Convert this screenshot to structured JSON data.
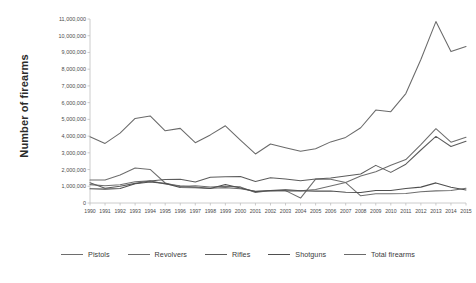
{
  "chart_data": {
    "type": "line",
    "title": "",
    "xlabel": "",
    "ylabel": "Number of firearms",
    "grid": false,
    "legend_position": "bottom",
    "ylim": [
      0,
      11000000
    ],
    "ytick_labels": [
      "11,000,000",
      "10,000,000",
      "9,000,000",
      "8,000,000",
      "7,000,000",
      "6,000,000",
      "5,000,000",
      "4,000,000",
      "3,000,000",
      "2,000,000",
      "1,000,000",
      "0"
    ],
    "ytick_values": [
      11000000,
      10000000,
      9000000,
      8000000,
      7000000,
      6000000,
      5000000,
      4000000,
      3000000,
      2000000,
      1000000,
      0
    ],
    "categories": [
      "1990",
      "1991",
      "1992",
      "1993",
      "1994",
      "1995",
      "1996",
      "1997",
      "1998",
      "1999",
      "2000",
      "2001",
      "2002",
      "2003",
      "2004",
      "2005",
      "2006",
      "2007",
      "2008",
      "2009",
      "2010",
      "2011",
      "2012",
      "2013",
      "2014",
      "2015"
    ],
    "x": [
      1990,
      1991,
      1992,
      1993,
      1994,
      1995,
      1996,
      1997,
      1998,
      1999,
      2000,
      2001,
      2002,
      2003,
      2004,
      2005,
      2006,
      2007,
      2008,
      2009,
      2010,
      2011,
      2012,
      2013,
      2014,
      2015
    ],
    "series": [
      {
        "name": "Pistols",
        "color": "#6e6e6e",
        "values": [
          1371427,
          1378252,
          1669537,
          2093362,
          2004298,
          1195284,
          987528,
          1036077,
          960365,
          995446,
          962901,
          626836,
          741514,
          811660,
          728511,
          803425,
          1021260,
          1219664,
          1609381,
          1868258,
          2258450,
          2598133,
          3487883,
          4441726,
          3633454,
          3930211
        ]
      },
      {
        "name": "Revolvers",
        "color": "#6e6e6e",
        "values": [
          1099415,
          1027203,
          1092123,
          1266780,
          1322380,
          1139043,
          1023340,
          952298,
          887055,
          919220,
          853964,
          705877,
          724595,
          741514,
          294099,
          1431121,
          1415085,
          1219664,
          431753,
          547195,
          558927,
          572857,
          667357,
          725282,
          744047,
          885259
        ]
      },
      {
        "name": "Rifles",
        "color": "#5c5c5c",
        "values": [
          1211664,
          883482,
          1001756,
          1173694,
          1316607,
          1411120,
          1424315,
          1251341,
          1535286,
          1569685,
          1583042,
          1284554,
          1515286,
          1430324,
          1325138,
          1431121,
          1496505,
          1610923,
          1734536,
          2248851,
          1830556,
          2318088,
          3168206,
          3979570,
          3379549,
          3691049
        ]
      },
      {
        "name": "Shotguns",
        "color": "#4f4f4f",
        "values": [
          848948,
          828426,
          868226,
          1144940,
          1254926,
          1173645,
          925732,
          915978,
          868639,
          1106995,
          898442,
          679813,
          741325,
          726078,
          731769,
          709313,
          714618,
          645231,
          630710,
          752699,
          743378,
          862401,
          949010,
          1203072,
          935411,
          777273
        ]
      },
      {
        "name": "Total firearms",
        "color": "#6a6a6a",
        "values": [
          3959450,
          3562222,
          4175993,
          5055637,
          5206426,
          4316146,
          4462136,
          3604880,
          4069973,
          4617347,
          3763345,
          2932834,
          3529492,
          3308404,
          3099025,
          3241494,
          3653324,
          3922613,
          4498944,
          5555818,
          5459240,
          6541886,
          8578610,
          10844792,
          9050626,
          9358661
        ]
      }
    ],
    "legend": [
      "Pistols",
      "Revolvers",
      "Rifles",
      "Shotguns",
      "Total firearms"
    ]
  },
  "plot": {
    "left": 90,
    "right": 466,
    "top": 19,
    "bottom": 203
  }
}
